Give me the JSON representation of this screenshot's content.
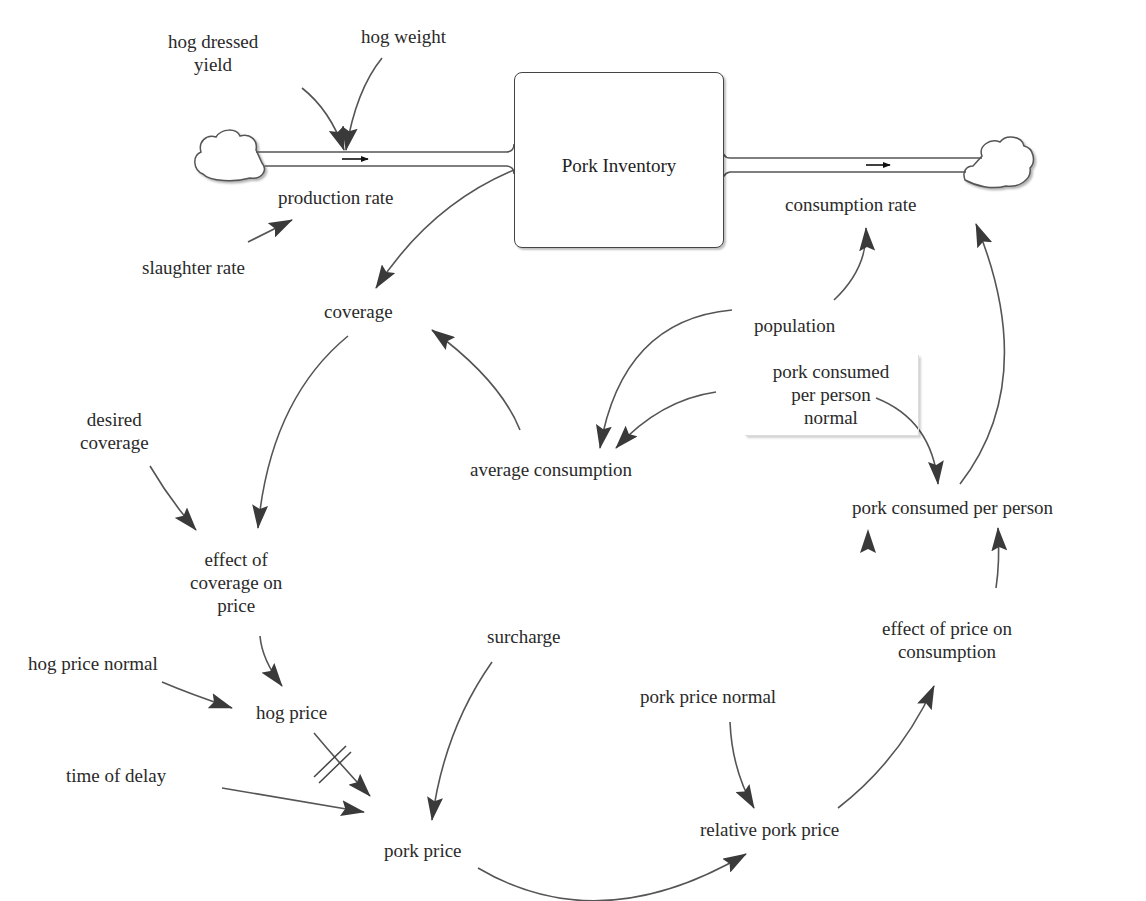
{
  "diagram": {
    "type": "stock-and-flow",
    "stock": {
      "label": "Pork Inventory"
    },
    "flows": [
      {
        "id": "production",
        "label": "production rate",
        "direction": "cloud-to-stock"
      },
      {
        "id": "consumption",
        "label": "consumption rate",
        "direction": "stock-to-cloud"
      }
    ],
    "variables": {
      "hog_dressed_yield": "hog dressed\nyield",
      "hog_dressed_yield_l1": "hog dressed",
      "hog_dressed_yield_l2": "yield",
      "hog_weight": "hog weight",
      "slaughter_rate": "slaughter rate",
      "coverage": "coverage",
      "population": "population",
      "pork_consumed_per_person_normal_l1": "pork consumed",
      "pork_consumed_per_person_normal_l2": "per person",
      "pork_consumed_per_person_normal_l3": "normal",
      "average_consumption": "average consumption",
      "desired_coverage_l1": "desired",
      "desired_coverage_l2": "coverage",
      "effect_of_coverage_on_price_l1": "effect of",
      "effect_of_coverage_on_price_l2": "coverage on",
      "effect_of_coverage_on_price_l3": "price",
      "pork_consumed_per_person": "pork consumed per person",
      "effect_of_price_on_consumption_l1": "effect of price on",
      "effect_of_price_on_consumption_l2": "consumption",
      "surcharge": "surcharge",
      "hog_price_normal": "hog price normal",
      "hog_price": "hog price",
      "time_of_delay": "time of delay",
      "pork_price": "pork price",
      "pork_price_normal": "pork price normal",
      "relative_pork_price": "relative pork price"
    },
    "links": [
      {
        "from": "hog dressed yield",
        "to": "production rate"
      },
      {
        "from": "hog weight",
        "to": "production rate"
      },
      {
        "from": "slaughter rate",
        "to": "production rate"
      },
      {
        "from": "Pork Inventory",
        "to": "coverage"
      },
      {
        "from": "average consumption",
        "to": "coverage"
      },
      {
        "from": "population",
        "to": "consumption rate"
      },
      {
        "from": "population",
        "to": "average consumption"
      },
      {
        "from": "pork consumed per person normal",
        "to": "average consumption"
      },
      {
        "from": "pork consumed per person normal",
        "to": "pork consumed per person"
      },
      {
        "from": "pork consumed per person",
        "to": "consumption rate"
      },
      {
        "from": "coverage",
        "to": "effect of coverage on price"
      },
      {
        "from": "desired coverage",
        "to": "effect of coverage on price"
      },
      {
        "from": "effect of coverage on price",
        "to": "hog price"
      },
      {
        "from": "hog price normal",
        "to": "hog price"
      },
      {
        "from": "hog price",
        "to": "pork price",
        "delay": true
      },
      {
        "from": "time of delay",
        "to": "pork price"
      },
      {
        "from": "surcharge",
        "to": "pork price"
      },
      {
        "from": "pork price",
        "to": "relative pork price"
      },
      {
        "from": "pork price normal",
        "to": "relative pork price"
      },
      {
        "from": "relative pork price",
        "to": "effect of price on consumption"
      },
      {
        "from": "effect of price on consumption",
        "to": "pork consumed per person"
      }
    ],
    "colors": {
      "line": "#555555",
      "arrowhead": "#333333",
      "text": "#2a2a2a"
    }
  }
}
